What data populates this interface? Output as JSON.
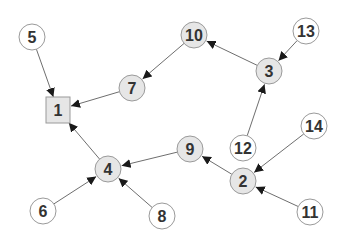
{
  "diagram": {
    "type": "directed-graph",
    "colors": {
      "edge": "#6e6e6e",
      "arrow": "#1a1a1a",
      "node_stroke": "#9a9a9a",
      "node_fill_gray": "#e6e6e6",
      "node_fill_white": "#ffffff",
      "label": "#333333"
    },
    "nodes": [
      {
        "id": "1",
        "label": "1",
        "shape": "square",
        "fill": "gray",
        "x": 58,
        "y": 110
      },
      {
        "id": "2",
        "label": "2",
        "shape": "circle",
        "fill": "gray",
        "x": 243,
        "y": 181
      },
      {
        "id": "3",
        "label": "3",
        "shape": "circle",
        "fill": "gray",
        "x": 269,
        "y": 71
      },
      {
        "id": "4",
        "label": "4",
        "shape": "circle",
        "fill": "gray",
        "x": 108,
        "y": 169
      },
      {
        "id": "5",
        "label": "5",
        "shape": "circle",
        "fill": "white",
        "x": 32,
        "y": 37
      },
      {
        "id": "6",
        "label": "6",
        "shape": "circle",
        "fill": "white",
        "x": 43,
        "y": 211
      },
      {
        "id": "7",
        "label": "7",
        "shape": "circle",
        "fill": "gray",
        "x": 132,
        "y": 88
      },
      {
        "id": "8",
        "label": "8",
        "shape": "circle",
        "fill": "white",
        "x": 162,
        "y": 216
      },
      {
        "id": "9",
        "label": "9",
        "shape": "circle",
        "fill": "gray",
        "x": 190,
        "y": 149
      },
      {
        "id": "10",
        "label": "10",
        "shape": "circle",
        "fill": "gray",
        "x": 194,
        "y": 35
      },
      {
        "id": "11",
        "label": "11",
        "shape": "circle",
        "fill": "white",
        "x": 310,
        "y": 212
      },
      {
        "id": "12",
        "label": "12",
        "shape": "circle",
        "fill": "white",
        "x": 243,
        "y": 148
      },
      {
        "id": "13",
        "label": "13",
        "shape": "circle",
        "fill": "white",
        "x": 306,
        "y": 31
      },
      {
        "id": "14",
        "label": "14",
        "shape": "circle",
        "fill": "white",
        "x": 314,
        "y": 126
      }
    ],
    "edges": [
      {
        "from": "5",
        "to": "1"
      },
      {
        "from": "7",
        "to": "1"
      },
      {
        "from": "4",
        "to": "1"
      },
      {
        "from": "10",
        "to": "7"
      },
      {
        "from": "3",
        "to": "10"
      },
      {
        "from": "13",
        "to": "3"
      },
      {
        "from": "12",
        "to": "3"
      },
      {
        "from": "9",
        "to": "4"
      },
      {
        "from": "2",
        "to": "9"
      },
      {
        "from": "14",
        "to": "2"
      },
      {
        "from": "11",
        "to": "2"
      },
      {
        "from": "6",
        "to": "4"
      },
      {
        "from": "8",
        "to": "4"
      }
    ]
  }
}
